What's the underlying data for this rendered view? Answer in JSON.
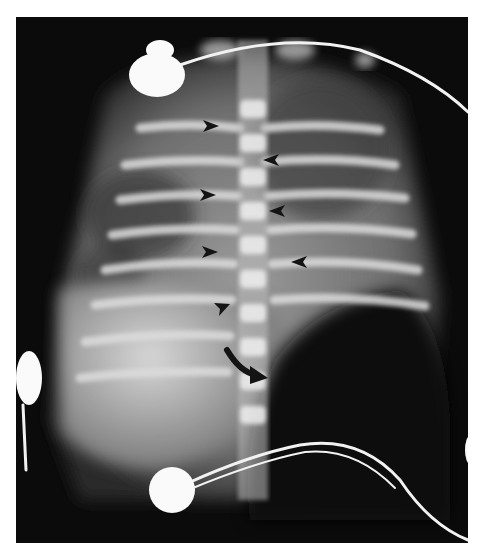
{
  "image": {
    "description": "Neonatal chest and abdomen radiograph with ECG electrodes and leads",
    "annotations": {
      "arrowheads": [
        {
          "x": 213,
          "y": 126,
          "direction": "right"
        },
        {
          "x": 270,
          "y": 160,
          "direction": "left"
        },
        {
          "x": 210,
          "y": 195,
          "direction": "right"
        },
        {
          "x": 276,
          "y": 211,
          "direction": "left"
        },
        {
          "x": 212,
          "y": 252,
          "direction": "right"
        },
        {
          "x": 298,
          "y": 262,
          "direction": "left"
        },
        {
          "x": 222,
          "y": 309,
          "direction": "down-right"
        }
      ],
      "curved_arrow": {
        "from": [
          228,
          352
        ],
        "to": [
          263,
          378
        ]
      }
    },
    "colors": {
      "background": "#0b0b0b",
      "margin": "#ffffff",
      "bone": "#e8e8e8",
      "soft_tissue": "#8a8a8a",
      "electrode": "#fafafa",
      "marker": "#1a1a1a"
    }
  }
}
